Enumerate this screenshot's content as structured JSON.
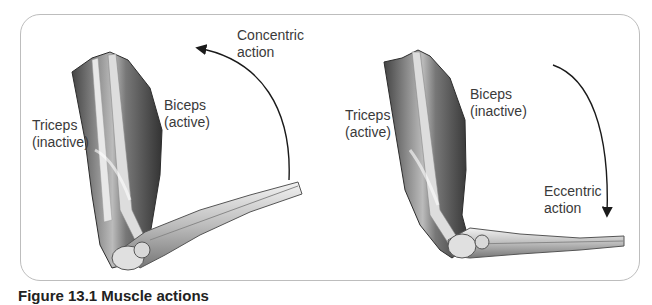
{
  "figure": {
    "panels": [
      {
        "id": "concentric",
        "action_label_line1": "Concentric",
        "action_label_line2": "action",
        "triceps_line1": "Triceps",
        "triceps_line2": "(inactive)",
        "biceps_line1": "Biceps",
        "biceps_line2": "(active)",
        "arrow_direction": "up"
      },
      {
        "id": "eccentric",
        "action_label_line1": "Eccentric",
        "action_label_line2": "action",
        "triceps_line1": "Triceps",
        "triceps_line2": "(active)",
        "biceps_line1": "Biceps",
        "biceps_line2": "(inactive)",
        "arrow_direction": "down"
      }
    ],
    "caption": "Figure 13.1  Muscle actions"
  },
  "colors": {
    "frame": "#bdbdbd",
    "muscle_dark": "#3c3c3c",
    "muscle_light": "#e6e6e6",
    "arrow": "#1a1a1a"
  }
}
